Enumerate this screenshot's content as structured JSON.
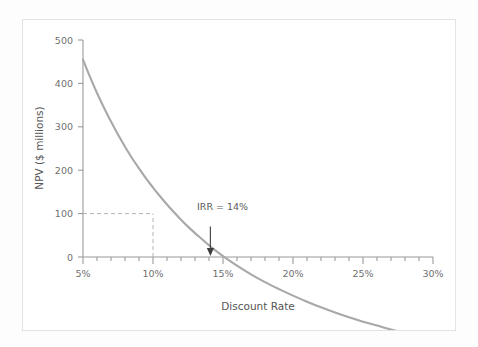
{
  "figure": {
    "background_color": "#ffffff",
    "frame_color": "#e3e3e3"
  },
  "chart_data": {
    "type": "line",
    "title": "",
    "subtitle": "",
    "xlabel": "Discount Rate",
    "ylabel": "NPV ($ millions)",
    "xlim": [
      5,
      30
    ],
    "ylim": [
      -110,
      500
    ],
    "grid": false,
    "legend": null,
    "legend_position": "none",
    "line_color": "#a8a8a8",
    "axis_color": "#9a9a9a",
    "x_tick_labels": [
      "5%",
      "10%",
      "15%",
      "20%",
      "25%",
      "30%"
    ],
    "x_tick_values": [
      5,
      10,
      15,
      20,
      25,
      30
    ],
    "x_minor_tick_interval": 1,
    "y_tick_labels": [
      "0",
      "100",
      "200",
      "300",
      "400",
      "500"
    ],
    "y_tick_values": [
      0,
      100,
      200,
      300,
      400,
      500
    ],
    "series": [
      {
        "name": "NPV",
        "x": [
          5,
          5.5,
          6,
          6.5,
          7,
          7.5,
          8,
          8.5,
          9,
          9.5,
          10,
          10.5,
          11,
          11.5,
          12,
          12.5,
          13,
          13.5,
          14,
          14.5,
          15,
          16,
          17,
          18,
          19,
          20,
          21,
          22,
          23,
          24,
          25,
          26,
          27,
          28,
          29,
          29.6
        ],
        "y": [
          455,
          415,
          378,
          344,
          312,
          282,
          254,
          228,
          204,
          181,
          160,
          140,
          121,
          103,
          86,
          70,
          55,
          41,
          27,
          14,
          2,
          -20,
          -40,
          -58,
          -74,
          -89,
          -103,
          -116,
          -128,
          -139,
          -149,
          -158,
          -167,
          -175,
          -182,
          -186
        ]
      }
    ],
    "annotations": [
      {
        "name": "irr-annotation",
        "text": "IRR = 14%",
        "x": 14.1,
        "y": 0,
        "label_x": 15.0,
        "label_y": 108,
        "arrow": true
      }
    ],
    "guide_lines": [
      {
        "name": "npv-100-horizontal",
        "orientation": "horizontal",
        "value": 100,
        "from_x": 5,
        "to_x": 10,
        "style": "dashed"
      },
      {
        "name": "rate-10-vertical",
        "orientation": "vertical",
        "value": 10,
        "from_y": 0,
        "to_y": 100,
        "style": "dashed"
      }
    ]
  }
}
